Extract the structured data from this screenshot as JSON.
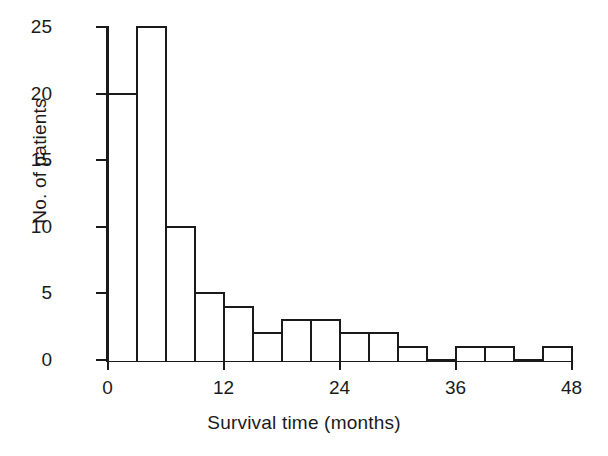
{
  "chart_data": {
    "type": "bar",
    "title": "",
    "subtitle": "",
    "xlabel": "Survival time (months)",
    "ylabel": "No. of patients",
    "xlim": [
      0,
      48
    ],
    "ylim": [
      0,
      25
    ],
    "grid": false,
    "legend": null,
    "bin_width": 3,
    "categories": [
      "0-3",
      "3-6",
      "6-9",
      "9-12",
      "12-15",
      "15-18",
      "18-21",
      "21-24",
      "24-27",
      "27-30",
      "30-33",
      "33-36",
      "36-39",
      "39-42",
      "42-45",
      "45-48"
    ],
    "bin_edges": [
      0,
      3,
      6,
      9,
      12,
      15,
      18,
      21,
      24,
      27,
      30,
      33,
      36,
      39,
      42,
      45,
      48
    ],
    "values": [
      20,
      25,
      10,
      5,
      4,
      2,
      3,
      3,
      2,
      2,
      1,
      0,
      1,
      1,
      0,
      1
    ],
    "x_ticks": [
      "0",
      "12",
      "24",
      "36",
      "48"
    ],
    "x_tick_values": [
      0,
      12,
      24,
      36,
      48
    ],
    "y_ticks": [
      "0",
      "5",
      "10",
      "15",
      "20",
      "25"
    ],
    "y_tick_values": [
      0,
      5,
      10,
      15,
      20,
      25
    ],
    "bar_fill": "#ffffff",
    "bar_stroke": "#1a1a1a",
    "axis_color": "#1a1a1a",
    "background": "#ffffff"
  }
}
